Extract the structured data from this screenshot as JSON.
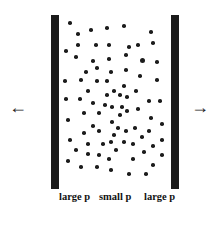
{
  "diagram": {
    "walls": [
      {
        "name": "left-wall",
        "x": 51,
        "y": 15,
        "width": 8,
        "height": 174
      },
      {
        "name": "right-wall",
        "x": 171,
        "y": 15,
        "width": 8,
        "height": 174
      }
    ],
    "arrows": {
      "left": {
        "glyph": "←",
        "x": 9,
        "y": 98
      },
      "right": {
        "glyph": "→",
        "x": 191,
        "y": 98
      }
    },
    "labels": [
      {
        "text": "large p",
        "x": 59
      },
      {
        "text": "small p",
        "x": 99
      },
      {
        "text": "large p",
        "x": 144
      }
    ],
    "dot_color": "#1c1c1c",
    "wall_color": "#1a1a1a",
    "dots": [
      [
        70,
        23
      ],
      [
        78,
        34
      ],
      [
        91,
        30
      ],
      [
        107,
        28
      ],
      [
        124,
        26
      ],
      [
        151,
        32
      ],
      [
        78,
        45
      ],
      [
        96,
        45
      ],
      [
        109,
        45
      ],
      [
        129,
        47
      ],
      [
        138,
        45
      ],
      [
        153,
        43
      ],
      [
        66,
        51
      ],
      [
        76,
        57
      ],
      [
        93,
        61
      ],
      [
        109,
        59
      ],
      [
        126,
        55
      ],
      [
        142,
        60,
        5
      ],
      [
        157,
        62
      ],
      [
        97,
        68
      ],
      [
        86,
        72
      ],
      [
        111,
        72
      ],
      [
        126,
        70
      ],
      [
        65,
        81
      ],
      [
        81,
        80
      ],
      [
        97,
        81
      ],
      [
        107,
        81
      ],
      [
        124,
        86
      ],
      [
        140,
        76
      ],
      [
        157,
        80
      ],
      [
        88,
        91
      ],
      [
        114,
        91
      ],
      [
        107,
        95
      ],
      [
        120,
        95
      ],
      [
        136,
        91
      ],
      [
        127,
        97
      ],
      [
        66,
        99
      ],
      [
        80,
        99
      ],
      [
        93,
        103
      ],
      [
        105,
        105
      ],
      [
        112,
        107
      ],
      [
        122,
        107
      ],
      [
        149,
        101
      ],
      [
        160,
        101
      ],
      [
        84,
        113
      ],
      [
        99,
        113
      ],
      [
        120,
        115
      ],
      [
        127,
        111
      ],
      [
        138,
        109
      ],
      [
        68,
        120
      ],
      [
        112,
        122
      ],
      [
        151,
        118
      ],
      [
        93,
        126
      ],
      [
        118,
        128
      ],
      [
        135,
        128
      ],
      [
        162,
        124
      ],
      [
        84,
        133
      ],
      [
        99,
        131
      ],
      [
        114,
        135
      ],
      [
        126,
        131
      ],
      [
        149,
        131
      ],
      [
        70,
        140
      ],
      [
        88,
        144
      ],
      [
        103,
        144
      ],
      [
        111,
        142
      ],
      [
        124,
        142
      ],
      [
        133,
        144
      ],
      [
        142,
        137
      ],
      [
        162,
        140
      ],
      [
        76,
        150
      ],
      [
        88,
        154
      ],
      [
        116,
        150
      ],
      [
        144,
        152
      ],
      [
        153,
        146
      ],
      [
        99,
        155
      ],
      [
        109,
        159
      ],
      [
        162,
        155
      ],
      [
        68,
        161
      ],
      [
        133,
        159
      ],
      [
        81,
        167
      ],
      [
        97,
        167
      ],
      [
        111,
        170
      ],
      [
        153,
        165
      ],
      [
        129,
        174
      ],
      [
        146,
        174
      ]
    ]
  }
}
